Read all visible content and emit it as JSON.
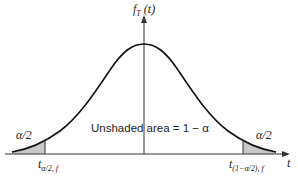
{
  "diagram": {
    "type": "probability-density-curve",
    "y_axis_label": {
      "main": "f",
      "sub": "T",
      "arg": "(t)"
    },
    "x_axis_label": "t",
    "center_label": "Unshaded area = 1 − α",
    "left_tail_label": "α/2",
    "right_tail_label": "α/2",
    "left_cutoff_label": {
      "main": "t",
      "sub": "α/2, f"
    },
    "right_cutoff_label": {
      "main": "t",
      "sub": "(1−α/2), f"
    },
    "colors": {
      "curve": "#111111",
      "axis": "#333333",
      "shade": "#c8c8c8"
    }
  }
}
